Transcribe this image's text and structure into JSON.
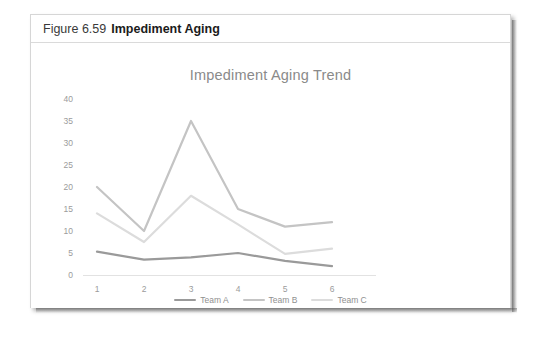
{
  "figure": {
    "label": "Figure 6.59",
    "title": "Impediment Aging"
  },
  "chart_data": {
    "type": "line",
    "title": "Impediment Aging Trend",
    "xlabel": "",
    "ylabel": "",
    "categories": [
      "1",
      "2",
      "3",
      "4",
      "5",
      "6"
    ],
    "x": [
      1,
      2,
      3,
      4,
      5,
      6
    ],
    "ylim": [
      0,
      40
    ],
    "ytick_values": [
      0,
      5,
      10,
      15,
      20,
      25,
      30,
      35,
      40
    ],
    "ytick_labels": [
      "0",
      "5",
      "10",
      "15",
      "20",
      "25",
      "30",
      "35",
      "40"
    ],
    "grid": false,
    "legend_position": "bottom",
    "series": [
      {
        "name": "Team A",
        "values": [
          5.3,
          3.5,
          4.0,
          5.0,
          3.2,
          2.0
        ],
        "color": "#9a9a9a"
      },
      {
        "name": "Team B",
        "values": [
          20.0,
          10.0,
          35.0,
          15.0,
          11.0,
          12.0
        ],
        "color": "#c4c4c4"
      },
      {
        "name": "Team C",
        "values": [
          14.0,
          7.5,
          18.0,
          11.5,
          4.8,
          6.0
        ],
        "color": "#dcdcdc"
      }
    ]
  },
  "axis": {
    "tick_0": "0",
    "tick_5": "5",
    "tick_10": "10",
    "tick_15": "15",
    "tick_20": "20",
    "tick_25": "25",
    "tick_30": "30",
    "tick_35": "35",
    "tick_40": "40",
    "x_1": "1",
    "x_2": "2",
    "x_3": "3",
    "x_4": "4",
    "x_5": "5",
    "x_6": "6"
  },
  "legend": {
    "items": [
      {
        "label": "Team A",
        "color": "#9a9a9a"
      },
      {
        "label": "Team B",
        "color": "#c4c4c4"
      },
      {
        "label": "Team C",
        "color": "#dcdcdc"
      }
    ]
  }
}
